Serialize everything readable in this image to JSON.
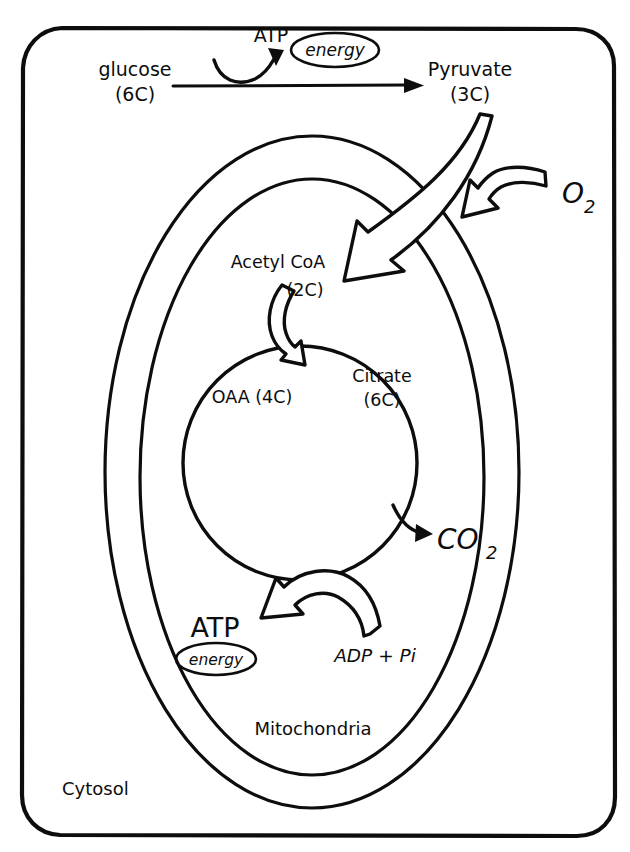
{
  "diagram": {
    "compartments": {
      "cytosol_label": "Cytosol",
      "mitochondria_label": "Mitochondria"
    },
    "glycolysis": {
      "substrate_name": "glucose",
      "substrate_carbons": "(6C)",
      "product_name": "Pyruvate",
      "product_carbons": "(3C)",
      "atp_label": "ATP",
      "energy_label": "energy"
    },
    "link_reaction": {
      "acetyl_name": "Acetyl CoA",
      "acetyl_carbons": "(2C)"
    },
    "krebs_cycle": {
      "oaa_label": "OAA (4C)",
      "citrate_name": "Citrate",
      "citrate_carbons": "(6C)"
    },
    "gases": {
      "oxygen_formula": "O",
      "oxygen_subscript": "2",
      "carbon_dioxide_formula": "CO",
      "carbon_dioxide_subscript": "2"
    },
    "oxidative_phosphorylation": {
      "atp_label": "ATP",
      "energy_label": "energy",
      "adp_label": "ADP + Pi"
    },
    "icons": {
      "glycolysis_arrow": "right-arrow-icon",
      "atp_hook_arrow": "curved-hook-arrow-icon",
      "pyruvate_import_arrow": "thick-hollow-curved-arrow-icon",
      "oxygen_inflow_arrow": "hollow-curved-arrow-icon",
      "acetyl_coa_arrow": "small-hollow-curved-arrow-icon",
      "co2_release_arrow": "small-solid-curved-arrow-icon",
      "atp_synthesis_arrow": "hollow-curved-arrow-icon"
    },
    "colors": {
      "ink": "#0d0d0d",
      "paper": "#ffffff"
    }
  }
}
